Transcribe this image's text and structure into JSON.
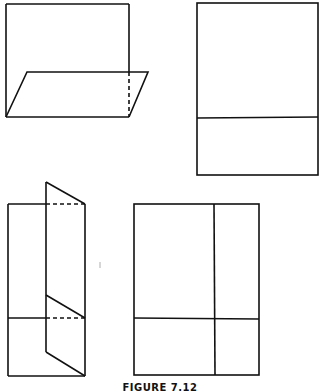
{
  "figure": {
    "caption": "FIGURE 7.12",
    "stroke_color": "#111111",
    "panels": [
      {
        "id": "a",
        "description": "Sheet with bottom flap folded forward, shown in perspective"
      },
      {
        "id": "b",
        "description": "Sheet with one horizontal fold line"
      },
      {
        "id": "c",
        "description": "Sheet with vertical flap folded back over right side"
      },
      {
        "id": "d",
        "description": "Sheet with one horizontal and one vertical fold line"
      }
    ]
  }
}
